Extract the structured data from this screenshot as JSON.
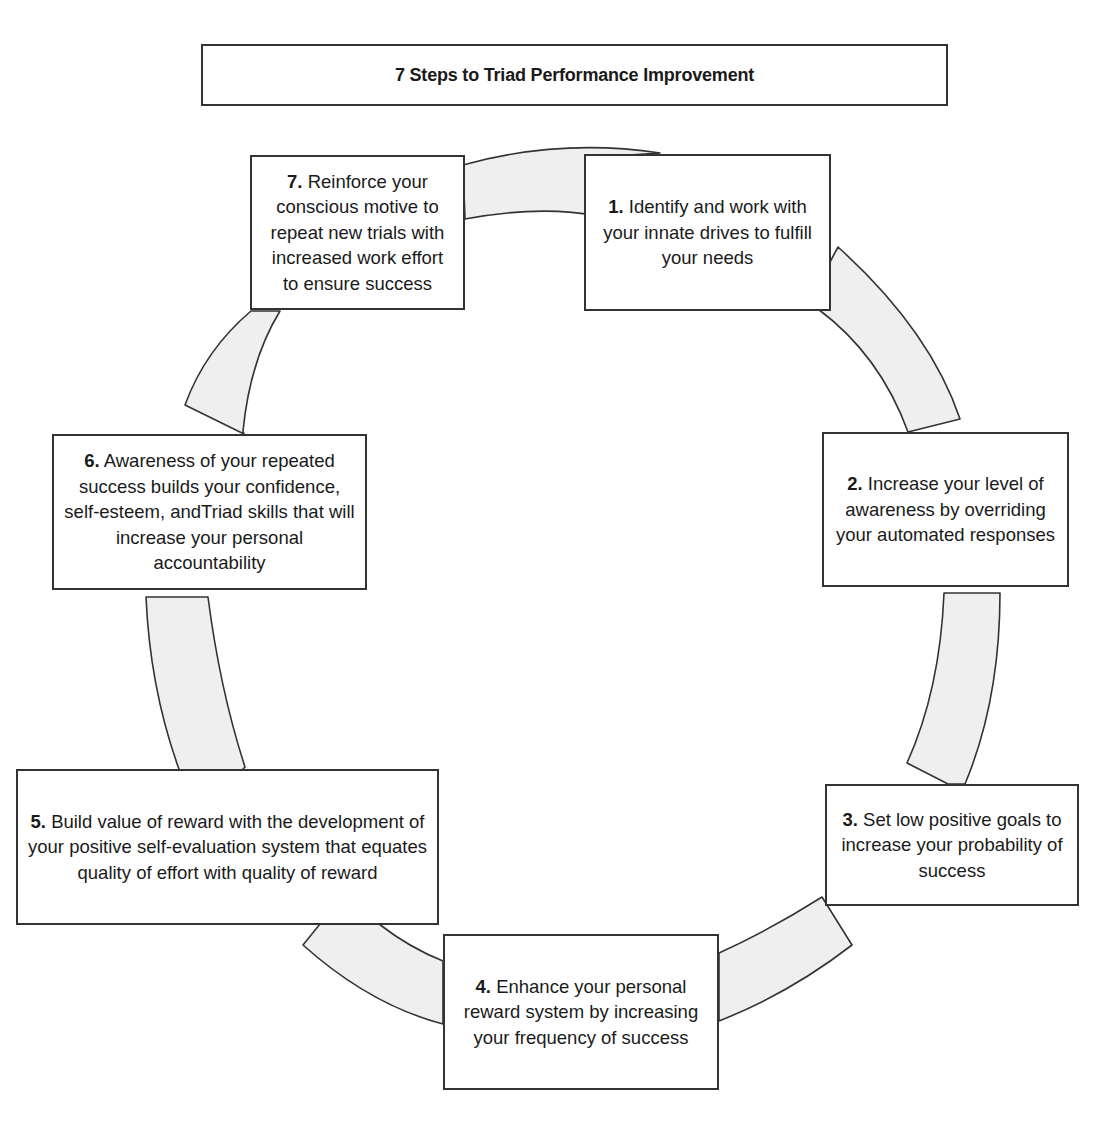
{
  "title": "7 Steps to Triad Performance Improvement",
  "colors": {
    "stroke": "#333333",
    "arc_fill": "#efefef",
    "box_fill": "#ffffff",
    "text": "#1a1a1a"
  },
  "steps": [
    {
      "number": "1.",
      "text": "Identify and work with your innate drives to fulfill your needs"
    },
    {
      "number": "2.",
      "text": "Increase your level of awareness by overriding your automated responses"
    },
    {
      "number": "3.",
      "text": "Set low positive goals to increase your probability of success"
    },
    {
      "number": "4.",
      "text": "Enhance your personal reward system by increasing your frequency of success"
    },
    {
      "number": "5.",
      "text": "Build value of reward with the development of your positive self-evaluation system that equates quality of effort with quality of reward"
    },
    {
      "number": "6.",
      "text": "Awareness of your repeated success builds your confidence, self-esteem, andTriad skills that will increase your personal accountability"
    },
    {
      "number": "7.",
      "text": "Reinforce your conscious motive to repeat new trials with increased work effort to ensure success"
    }
  ],
  "flow": [
    "1 → 2",
    "2 → 3",
    "3 → 4",
    "4 → 5",
    "5 → 6",
    "6 → 7",
    "7 → 1"
  ]
}
